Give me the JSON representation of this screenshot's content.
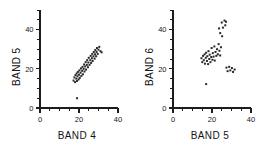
{
  "figure": {
    "background": "#ffffff",
    "point_color": "#2a2a2a",
    "axis_color": "#1c1c1c"
  },
  "chart_data": [
    {
      "type": "scatter",
      "title": "",
      "xlabel": "BAND 4",
      "ylabel": "BAND 5",
      "xlim": [
        0,
        40
      ],
      "ylim": [
        0,
        50
      ],
      "xticks": [
        0,
        20,
        40
      ],
      "yticks": [
        0,
        20,
        40
      ],
      "xtick_labels": [
        "0",
        "20",
        "40"
      ],
      "ytick_labels": [
        "0",
        "20",
        "40"
      ],
      "minor_tick_step": 5,
      "grid": false,
      "legend": "none",
      "marker": "square",
      "marker_size_px": 2,
      "points": [
        [
          17.2,
          14.0
        ],
        [
          17.6,
          15.6
        ],
        [
          18.0,
          13.2
        ],
        [
          18.2,
          16.8
        ],
        [
          18.6,
          15.0
        ],
        [
          18.8,
          17.6
        ],
        [
          19.0,
          13.8
        ],
        [
          19.2,
          16.2
        ],
        [
          19.4,
          18.4
        ],
        [
          19.8,
          14.6
        ],
        [
          20.0,
          17.0
        ],
        [
          20.2,
          19.2
        ],
        [
          20.4,
          15.4
        ],
        [
          20.8,
          18.0
        ],
        [
          21.0,
          20.2
        ],
        [
          21.2,
          16.4
        ],
        [
          21.6,
          19.0
        ],
        [
          21.8,
          21.0
        ],
        [
          22.0,
          17.2
        ],
        [
          22.4,
          20.0
        ],
        [
          22.6,
          22.2
        ],
        [
          22.8,
          18.6
        ],
        [
          23.2,
          21.2
        ],
        [
          23.4,
          23.4
        ],
        [
          23.6,
          19.6
        ],
        [
          24.0,
          22.0
        ],
        [
          24.2,
          24.4
        ],
        [
          24.6,
          20.8
        ],
        [
          24.8,
          23.2
        ],
        [
          25.0,
          25.6
        ],
        [
          25.4,
          22.0
        ],
        [
          25.8,
          24.4
        ],
        [
          26.0,
          26.6
        ],
        [
          26.2,
          23.0
        ],
        [
          26.6,
          25.4
        ],
        [
          26.8,
          27.6
        ],
        [
          27.0,
          24.0
        ],
        [
          27.4,
          26.4
        ],
        [
          27.6,
          28.6
        ],
        [
          28.0,
          25.2
        ],
        [
          28.2,
          27.4
        ],
        [
          28.4,
          29.6
        ],
        [
          28.8,
          26.4
        ],
        [
          29.0,
          28.6
        ],
        [
          29.2,
          30.6
        ],
        [
          29.6,
          27.6
        ],
        [
          30.0,
          29.8
        ],
        [
          30.4,
          31.2
        ],
        [
          31.0,
          29.0
        ],
        [
          31.6,
          28.4
        ],
        [
          19.0,
          5.0
        ]
      ]
    },
    {
      "type": "scatter",
      "title": "",
      "xlabel": "BAND 5",
      "ylabel": "BAND 6",
      "xlim": [
        0,
        40
      ],
      "ylim": [
        0,
        50
      ],
      "xticks": [
        0,
        20,
        40
      ],
      "yticks": [
        0,
        20,
        40
      ],
      "xtick_labels": [
        "0",
        "20",
        "40"
      ],
      "ytick_labels": [
        "0",
        "20",
        "40"
      ],
      "minor_tick_step": 5,
      "grid": false,
      "legend": "none",
      "marker": "square",
      "marker_size_px": 2,
      "points": [
        [
          14.6,
          25.4
        ],
        [
          15.0,
          23.4
        ],
        [
          15.4,
          26.6
        ],
        [
          15.8,
          24.4
        ],
        [
          16.2,
          27.4
        ],
        [
          16.4,
          22.6
        ],
        [
          16.8,
          25.6
        ],
        [
          17.0,
          28.2
        ],
        [
          17.4,
          24.0
        ],
        [
          17.6,
          26.4
        ],
        [
          18.0,
          22.4
        ],
        [
          18.2,
          29.0
        ],
        [
          18.6,
          25.0
        ],
        [
          18.8,
          27.2
        ],
        [
          19.2,
          23.4
        ],
        [
          19.6,
          26.0
        ],
        [
          19.8,
          30.6
        ],
        [
          20.2,
          24.6
        ],
        [
          20.4,
          28.0
        ],
        [
          20.8,
          26.2
        ],
        [
          21.2,
          31.4
        ],
        [
          21.4,
          24.2
        ],
        [
          21.8,
          28.6
        ],
        [
          22.2,
          26.6
        ],
        [
          22.6,
          30.0
        ],
        [
          23.0,
          27.4
        ],
        [
          23.4,
          32.6
        ],
        [
          23.8,
          29.2
        ],
        [
          24.2,
          26.8
        ],
        [
          24.6,
          31.0
        ],
        [
          23.6,
          40.6
        ],
        [
          24.2,
          38.2
        ],
        [
          25.0,
          43.6
        ],
        [
          25.6,
          41.0
        ],
        [
          26.4,
          44.6
        ],
        [
          26.8,
          42.2
        ],
        [
          27.2,
          44.0
        ],
        [
          25.2,
          36.6
        ],
        [
          27.4,
          20.6
        ],
        [
          28.0,
          18.8
        ],
        [
          28.8,
          21.0
        ],
        [
          29.4,
          19.2
        ],
        [
          30.2,
          20.4
        ],
        [
          30.8,
          18.4
        ],
        [
          31.6,
          19.6
        ],
        [
          17.0,
          12.2
        ]
      ]
    }
  ]
}
